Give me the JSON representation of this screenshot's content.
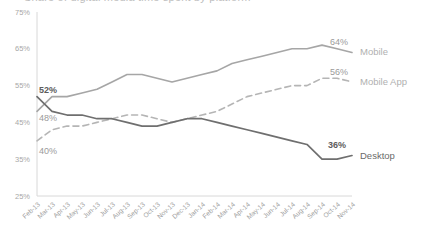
{
  "chart_data": {
    "type": "line",
    "title": "Share of digital media time spent by platform",
    "xlabel": "",
    "ylabel": "",
    "ylim": [
      25,
      75
    ],
    "yticks": [
      "25%",
      "35%",
      "45%",
      "55%",
      "65%",
      "75%"
    ],
    "ytick_values": [
      25,
      35,
      45,
      55,
      65,
      75
    ],
    "grid": false,
    "legend_position": "right-inline-endpoint-labels",
    "categories": [
      "Feb-13",
      "Mar-13",
      "Apr-13",
      "May-13",
      "Jun-13",
      "Jul-13",
      "Aug-13",
      "Sep-13",
      "Oct-13",
      "Nov-13",
      "Dec-13",
      "Jan-14",
      "Feb-14",
      "Mar-14",
      "Apr-14",
      "May-14",
      "Jun-14",
      "Jul-14",
      "Aug-14",
      "Sep-14",
      "Oct-14",
      "Nov-14"
    ],
    "series": [
      {
        "name": "Mobile",
        "style": "solid",
        "color": "#a6a6a6",
        "start_label": "48%",
        "end_label": "64%",
        "values": [
          48,
          52,
          52,
          53,
          54,
          56,
          58,
          58,
          57,
          56,
          57,
          58,
          59,
          61,
          62,
          63,
          64,
          65,
          65,
          66,
          65,
          64
        ]
      },
      {
        "name": "Mobile App",
        "style": "dashed",
        "color": "#b5b5b5",
        "start_label": "40%",
        "end_label": "56%",
        "values": [
          40,
          43,
          44,
          44,
          45,
          46,
          47,
          47,
          46,
          45,
          46,
          47,
          48,
          50,
          52,
          53,
          54,
          55,
          55,
          57,
          57,
          56
        ]
      },
      {
        "name": "Desktop",
        "style": "solid",
        "color": "#6f6f6f",
        "start_label": "52%",
        "end_label": "36%",
        "values": [
          52,
          48,
          47,
          47,
          46,
          46,
          45,
          44,
          44,
          45,
          46,
          46,
          45,
          44,
          43,
          42,
          41,
          40,
          39,
          35,
          35,
          36
        ]
      }
    ]
  }
}
